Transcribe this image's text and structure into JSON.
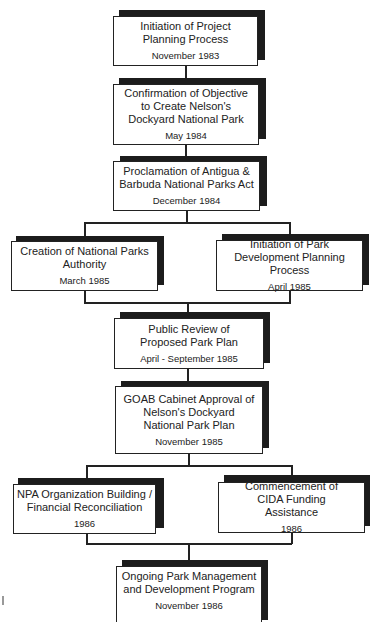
{
  "diagram": {
    "type": "flowchart",
    "nodes": [
      {
        "id": "n1",
        "title": "Initiation of Project Planning Process",
        "date": "November 1983"
      },
      {
        "id": "n2",
        "title": "Confirmation of Objective to Create Nelson's Dockyard National Park",
        "date": "May 1984"
      },
      {
        "id": "n3",
        "title": "Proclamation of Antigua & Barbuda National Parks Act",
        "date": "December 1984"
      },
      {
        "id": "n4",
        "title": "Creation of National Parks Authority",
        "date": "March 1985"
      },
      {
        "id": "n5",
        "title": "Initiation of Park Development Planning Process",
        "date": "April 1985"
      },
      {
        "id": "n6",
        "title": "Public Review of Proposed Park Plan",
        "date": "April - September 1985"
      },
      {
        "id": "n7",
        "title": "GOAB Cabinet Approval of Nelson's Dockyard National Park Plan",
        "date": "November 1985"
      },
      {
        "id": "n8",
        "title": "NPA Organization Building / Financial Reconciliation",
        "date": "1986"
      },
      {
        "id": "n9",
        "title": "Commencement of CIDA Funding Assistance",
        "date": "1986"
      },
      {
        "id": "n10",
        "title": "Ongoing Park Management and Development Program",
        "date": "November 1986"
      }
    ],
    "edges": [
      [
        "n1",
        "n2"
      ],
      [
        "n2",
        "n3"
      ],
      [
        "n3",
        "n4"
      ],
      [
        "n3",
        "n5"
      ],
      [
        "n4",
        "n6"
      ],
      [
        "n5",
        "n6"
      ],
      [
        "n6",
        "n7"
      ],
      [
        "n7",
        "n8"
      ],
      [
        "n7",
        "n9"
      ],
      [
        "n8",
        "n10"
      ],
      [
        "n9",
        "n10"
      ]
    ]
  }
}
